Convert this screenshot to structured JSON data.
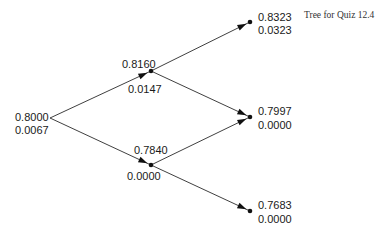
{
  "caption": "Tree for Quiz 12.4",
  "tree": {
    "nodes": [
      {
        "id": "root",
        "value": "0.8000",
        "sub": "0.0067"
      },
      {
        "id": "up",
        "value": "0.8160",
        "sub": "0.0147"
      },
      {
        "id": "down",
        "value": "0.7840",
        "sub": "0.0000"
      },
      {
        "id": "uu",
        "value": "0.8323",
        "sub": "0.0323"
      },
      {
        "id": "ud",
        "value": "0.7997",
        "sub": "0.0000"
      },
      {
        "id": "dd",
        "value": "0.7683",
        "sub": "0.0000"
      }
    ],
    "edges": [
      {
        "from": "root",
        "to": "up"
      },
      {
        "from": "root",
        "to": "down"
      },
      {
        "from": "up",
        "to": "uu"
      },
      {
        "from": "up",
        "to": "ud"
      },
      {
        "from": "down",
        "to": "ud"
      },
      {
        "from": "down",
        "to": "dd"
      }
    ]
  }
}
